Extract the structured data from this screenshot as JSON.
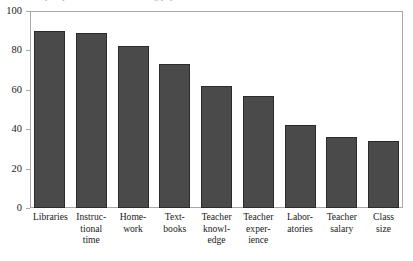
{
  "figure": {
    "clipped_title": "Survey responses on factors affecting pupil achievement"
  },
  "chart_data": {
    "type": "bar",
    "title": "",
    "xlabel": "",
    "ylabel": "",
    "ylim": [
      0,
      100
    ],
    "grid": false,
    "legend": "none",
    "yticks": [
      "0",
      "20",
      "40",
      "60",
      "80",
      "100"
    ],
    "ytick_values": [
      0,
      20,
      40,
      60,
      80,
      100
    ],
    "categories": [
      "Libraries",
      "Instructional time",
      "Homework",
      "Textbooks",
      "Teacher knowledge",
      "Teacher experience",
      "Laboratories",
      "Teacher salary",
      "Class size"
    ],
    "category_lines": [
      [
        "Libraries"
      ],
      [
        "Instruc-",
        "tional",
        "time"
      ],
      [
        "Home-",
        "work"
      ],
      [
        "Text-",
        "books"
      ],
      [
        "Teacher",
        "knowl-",
        "edge"
      ],
      [
        "Teacher",
        "exper-",
        "ience"
      ],
      [
        "Labor-",
        "atories"
      ],
      [
        "Teacher",
        "salary"
      ],
      [
        "Class",
        "size"
      ]
    ],
    "values": [
      90,
      89,
      82,
      73,
      62,
      57,
      42,
      36,
      34
    ],
    "colors": {
      "bar_fill": "#4a4a4a",
      "bar_border": "#2b2b2b",
      "frame": "#a8a8a8",
      "background": "#ffffff",
      "text": "#1a1a1a"
    }
  }
}
